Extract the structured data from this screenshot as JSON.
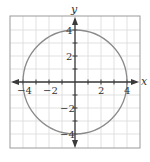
{
  "chart_data": {
    "type": "line",
    "title": "",
    "xlabel": "x",
    "ylabel": "y",
    "xlim": [
      -5,
      5
    ],
    "ylim": [
      -5,
      5
    ],
    "grid": true,
    "grid_step": 1,
    "x_ticks": [
      -4,
      -2,
      2,
      4
    ],
    "y_ticks": [
      4,
      2,
      -2,
      -4
    ],
    "x_tick_labels": [
      "−4",
      "−2",
      "2",
      "4"
    ],
    "y_tick_labels": [
      "4",
      "2",
      "−2",
      "−4"
    ],
    "series": [
      {
        "name": "circle",
        "equation": "x^2 + y^2 = 16",
        "center": [
          0,
          0
        ],
        "radius": 4
      }
    ],
    "legend": "none"
  },
  "colors": {
    "background": "#ffffff",
    "grid": "#d9d9d9",
    "frame": "#9a9a9a",
    "axis": "#3a3a3a",
    "curve": "#8a8a8a"
  }
}
